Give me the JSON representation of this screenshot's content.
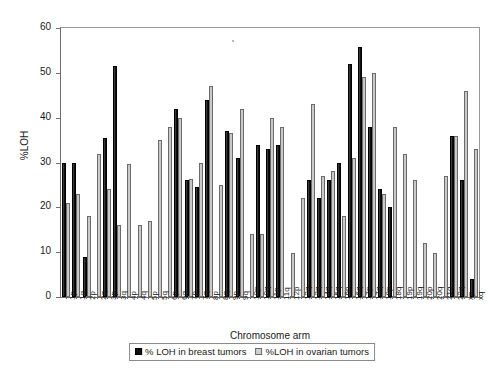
{
  "chart_data": {
    "type": "bar",
    "title": "",
    "xlabel": "Chromosome arm",
    "ylabel": "%LOH",
    "ylim": [
      0,
      60
    ],
    "ytick_values": [
      0,
      10,
      20,
      30,
      40,
      50,
      60
    ],
    "ytick_labels": [
      "0",
      "10",
      "20",
      "30",
      "40",
      "50",
      "60"
    ],
    "grid": false,
    "legend_position": "bottom",
    "categories": [
      "1p",
      "1q",
      "2p",
      "2q",
      "3p",
      "3q",
      "4p",
      "4q",
      "5p",
      "5q",
      "6p",
      "6q",
      "7p",
      "7q",
      "8p",
      "8q",
      "9p",
      "9q",
      "10p",
      "10q",
      "11p",
      "11q",
      "12p",
      "12q",
      "13q",
      "14q",
      "15q",
      "16p",
      "16q",
      "17p",
      "17q",
      "18p",
      "18q",
      "19p",
      "19q",
      "20p",
      "20q",
      "21q",
      "22q",
      "xp",
      "xq"
    ],
    "series": [
      {
        "name": "% LOH in breast tumors",
        "color": "#101010",
        "values": [
          30,
          30,
          9,
          null,
          35.5,
          51.5,
          null,
          null,
          null,
          null,
          null,
          42,
          26,
          24.5,
          44,
          null,
          37,
          31,
          null,
          34,
          33,
          34,
          null,
          null,
          26,
          22,
          26,
          29.8,
          52,
          55.8,
          38,
          24,
          20,
          null,
          null,
          null,
          null,
          null,
          36,
          26,
          4
        ]
      },
      {
        "name": "%LOH in ovarian tumors",
        "color": "#c9c9c9",
        "values": [
          21,
          23,
          18,
          32,
          24,
          16,
          29.7,
          16,
          17,
          35,
          38,
          40,
          26.3,
          30,
          47,
          25,
          36.5,
          42,
          14,
          14,
          40,
          38,
          9.8,
          22,
          43,
          27,
          28,
          18,
          31,
          49,
          50,
          23,
          38,
          32,
          26,
          12,
          9.8,
          27,
          36,
          46,
          33
        ]
      }
    ]
  },
  "legend": {
    "items": [
      {
        "label": "% LOH in breast tumors",
        "swatch": "black-square-swatch"
      },
      {
        "label": "%LOH in ovarian tumors",
        "swatch": "grey-square-swatch"
      }
    ]
  },
  "axes": {
    "y_title": "%LOH",
    "x_title": "Chromosome arm"
  }
}
